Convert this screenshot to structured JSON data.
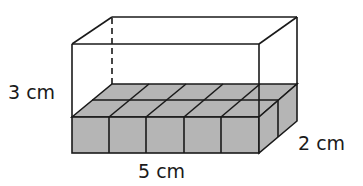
{
  "figure": {
    "type": "rectangular-prism-volume",
    "labels": {
      "height": "3 cm",
      "length": "5 cm",
      "width": "2 cm"
    },
    "dimensions": {
      "length_cm": 5,
      "width_cm": 2,
      "height_cm": 3
    },
    "cube_layer": {
      "columns": 5,
      "rows": 2,
      "layers_filled": 1
    },
    "colors": {
      "outline": "#1a1a1a",
      "cube_fill": "#b5b5b5",
      "background": "#ffffff"
    }
  }
}
